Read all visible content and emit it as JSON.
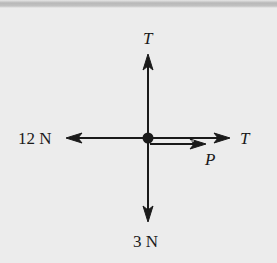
{
  "diagram": {
    "type": "free-body diagram",
    "center_point": "particle",
    "forces": [
      {
        "id": "up",
        "label": "T",
        "direction": "up"
      },
      {
        "id": "left",
        "label": "12 N",
        "direction": "left"
      },
      {
        "id": "right",
        "label": "T",
        "direction": "right"
      },
      {
        "id": "p",
        "label": "P",
        "direction": "right"
      },
      {
        "id": "down",
        "label": "3 N",
        "direction": "down"
      }
    ],
    "colors": {
      "ink": "#1a1a1a",
      "background": "#ececec"
    }
  }
}
